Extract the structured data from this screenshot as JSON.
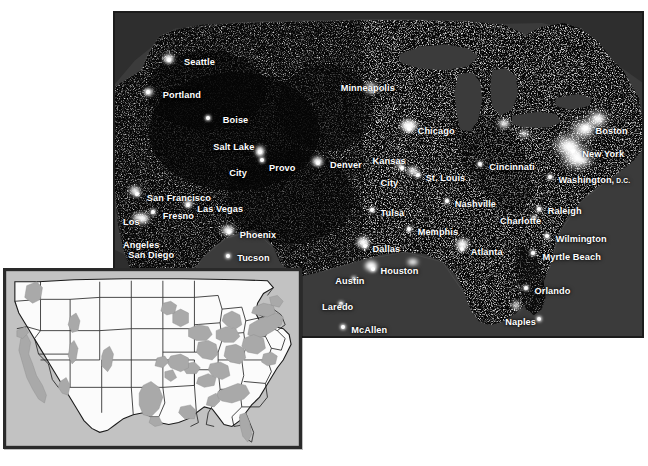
{
  "figure": {
    "background_color": "#ffffff"
  },
  "night_map": {
    "name": "us-night-lights-map",
    "frame_color": "#1c1c1c",
    "land_color": "#0a0a0a",
    "water_color": "#3b3b3b",
    "light_color": "#ffffff",
    "label_color": "#ffffff",
    "cities": [
      {
        "label": "Seattle",
        "x": 13.0,
        "y": 13.5,
        "align": "left",
        "dot_x": 10.2,
        "dot_y": 14.3
      },
      {
        "label": "Portland",
        "x": 9.0,
        "y": 23.5,
        "align": "left",
        "dot_x": 6.3,
        "dot_y": 24.3
      },
      {
        "label": "Boise",
        "x": 20.3,
        "y": 31.2,
        "align": "left",
        "dot_x": 17.6,
        "dot_y": 32.0
      },
      {
        "label": "Salt Lake",
        "x": 18.5,
        "y": 39.5,
        "align": "left",
        "dot_x": 27.4,
        "dot_y": 42.6
      },
      {
        "label": "City",
        "x": 21.5,
        "y": 47.5,
        "align": "left",
        "dot_x": null,
        "dot_y": null
      },
      {
        "label": "Provo",
        "x": 29.0,
        "y": 45.8,
        "align": "left",
        "dot_x": 27.6,
        "dot_y": 45.0
      },
      {
        "label": "Denver",
        "x": 40.5,
        "y": 45.0,
        "align": "left",
        "dot_x": 38.2,
        "dot_y": 45.8
      },
      {
        "label": "San Francisco",
        "x": 6.0,
        "y": 55.0,
        "align": "left",
        "dot_x": 4.1,
        "dot_y": 55.4
      },
      {
        "label": "Fresno",
        "x": 9.0,
        "y": 60.5,
        "align": "left",
        "dot_x": 7.2,
        "dot_y": 61.0
      },
      {
        "label": "Las Vegas",
        "x": 15.5,
        "y": 58.4,
        "align": "left",
        "dot_x": 13.8,
        "dot_y": 58.8
      },
      {
        "label": "Los",
        "x": 1.5,
        "y": 62.5,
        "align": "left",
        "dot_x": null,
        "dot_y": null
      },
      {
        "label": "Angeles",
        "x": 1.5,
        "y": 69.5,
        "align": "left",
        "dot_x": null,
        "dot_y": null
      },
      {
        "label": "San Diego",
        "x": 2.5,
        "y": 72.5,
        "align": "left",
        "dot_x": null,
        "dot_y": null
      },
      {
        "label": "Phoenix",
        "x": 23.5,
        "y": 66.5,
        "align": "left",
        "dot_x": 21.4,
        "dot_y": 67.0
      },
      {
        "label": "Tucson",
        "x": 23.0,
        "y": 73.5,
        "align": "left",
        "dot_x": 21.2,
        "dot_y": 74.2
      },
      {
        "label": "Minneapolis",
        "x": 42.5,
        "y": 21.5,
        "align": "left",
        "dot_x": 48.4,
        "dot_y": 23.6
      },
      {
        "label": "Chicago",
        "x": 57.0,
        "y": 34.5,
        "align": "left",
        "dot_x": 55.4,
        "dot_y": 35.4
      },
      {
        "label": "Kansas",
        "x": 48.5,
        "y": 43.8,
        "align": "left",
        "dot_x": null,
        "dot_y": null
      },
      {
        "label": "City",
        "x": 50.0,
        "y": 50.5,
        "align": "left",
        "dot_x": 54.0,
        "dot_y": 47.3
      },
      {
        "label": "St. Louis",
        "x": 58.5,
        "y": 49.0,
        "align": "left",
        "dot_x": 57.0,
        "dot_y": 49.6
      },
      {
        "label": "Cincinnati",
        "x": 70.5,
        "y": 45.5,
        "align": "left",
        "dot_x": 68.8,
        "dot_y": 46.2
      },
      {
        "label": "Boston",
        "x": 90.5,
        "y": 34.5,
        "align": "left",
        "dot_x": 88.7,
        "dot_y": 35.2
      },
      {
        "label": "New York",
        "x": 88.0,
        "y": 41.5,
        "align": "left",
        "dot_x": 86.3,
        "dot_y": 42.2
      },
      {
        "label": "Washington,",
        "x": 83.5,
        "y": 49.5,
        "align": "left",
        "dot_x": 82.0,
        "dot_y": 50.2,
        "sub": " D.C."
      },
      {
        "label": "Nashville",
        "x": 64.0,
        "y": 56.8,
        "align": "left",
        "dot_x": 62.6,
        "dot_y": 57.5
      },
      {
        "label": "Charlotte",
        "x": 72.5,
        "y": 62.0,
        "align": "left",
        "dot_x": 78.9,
        "dot_y": 62.6
      },
      {
        "label": "Raleigh",
        "x": 81.5,
        "y": 59.0,
        "align": "left",
        "dot_x": 79.8,
        "dot_y": 59.8
      },
      {
        "label": "Wilmington",
        "x": 83.0,
        "y": 67.5,
        "align": "left",
        "dot_x": 81.4,
        "dot_y": 68.2
      },
      {
        "label": "Myrtle Beach",
        "x": 80.5,
        "y": 73.0,
        "align": "left",
        "dot_x": 78.8,
        "dot_y": 73.5
      },
      {
        "label": "Tulsa",
        "x": 50.0,
        "y": 59.5,
        "align": "left",
        "dot_x": 48.4,
        "dot_y": 60.2
      },
      {
        "label": "Memphis",
        "x": 57.0,
        "y": 65.5,
        "align": "left",
        "dot_x": 55.3,
        "dot_y": 66.2
      },
      {
        "label": "Atlanta",
        "x": 67.0,
        "y": 71.5,
        "align": "left",
        "dot_x": 65.4,
        "dot_y": 72.1
      },
      {
        "label": "Dallas",
        "x": 48.5,
        "y": 70.5,
        "align": "left",
        "dot_x": 47.0,
        "dot_y": 71.2
      },
      {
        "label": "Houston",
        "x": 50.0,
        "y": 77.5,
        "align": "left",
        "dot_x": 48.5,
        "dot_y": 78.2
      },
      {
        "label": "Austin",
        "x": 41.5,
        "y": 80.5,
        "align": "left",
        "dot_x": 45.0,
        "dot_y": 81.2
      },
      {
        "label": "Laredo",
        "x": 39.0,
        "y": 88.5,
        "align": "left",
        "dot_x": 42.6,
        "dot_y": 89.0
      },
      {
        "label": "McAllen",
        "x": 44.5,
        "y": 95.5,
        "align": "left",
        "dot_x": 42.9,
        "dot_y": 96.0
      },
      {
        "label": "Orlando",
        "x": 79.0,
        "y": 83.5,
        "align": "left",
        "dot_x": 77.4,
        "dot_y": 84.0
      },
      {
        "label": "Naples",
        "x": 73.5,
        "y": 93.0,
        "align": "left",
        "dot_x": 79.8,
        "dot_y": 93.6
      }
    ]
  },
  "inset_map": {
    "name": "us-reference-inset-map",
    "frame_color": "#2a2a2a",
    "land_color": "#fbfbfb",
    "border_color": "#1a1a1a",
    "urban_shade_color": "#a9a9a9",
    "outside_color": "#bdbdbd",
    "description": "Reference outline map of the contiguous United States with state boundaries; gray shading marks metropolitan/urbanized corridors."
  }
}
